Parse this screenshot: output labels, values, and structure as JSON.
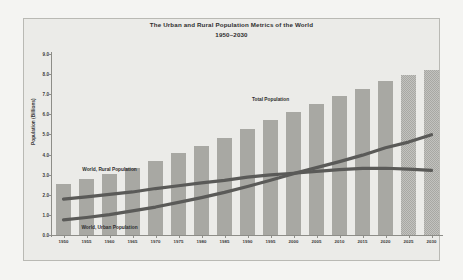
{
  "chart_data": {
    "type": "bar",
    "title": "The Urban and Rural Population Metrics of the World",
    "subtitle": "1950–2030",
    "xlabel": "",
    "ylabel": "Population (Billions)",
    "ylim": [
      0.0,
      9.0
    ],
    "yticks": [
      "0.0",
      "1.0",
      "2.0",
      "3.0",
      "4.0",
      "5.0",
      "6.0",
      "7.0",
      "8.0",
      "9.0"
    ],
    "grid": false,
    "legend_position": "inline-annotations",
    "categories": [
      "1950",
      "1955",
      "1960",
      "1965",
      "1970",
      "1975",
      "1980",
      "1985",
      "1990",
      "1995",
      "2000",
      "2005",
      "2010",
      "2015",
      "2020",
      "2025",
      "2030"
    ],
    "series": [
      {
        "name": "Total Population",
        "type": "bar",
        "color": "#a8a8a3",
        "values": [
          2.53,
          2.77,
          3.03,
          3.34,
          3.7,
          4.07,
          4.45,
          4.84,
          5.29,
          5.71,
          6.12,
          6.51,
          6.9,
          7.28,
          7.66,
          7.94,
          8.2
        ]
      },
      {
        "name": "World, Rural Population",
        "type": "line",
        "color": "#5a5a58",
        "values": [
          1.78,
          1.9,
          2.02,
          2.14,
          2.31,
          2.45,
          2.59,
          2.72,
          2.88,
          2.99,
          3.07,
          3.16,
          3.25,
          3.31,
          3.32,
          3.28,
          3.21
        ]
      },
      {
        "name": "World, Urban Population",
        "type": "line",
        "color": "#5a5a58",
        "values": [
          0.75,
          0.87,
          1.01,
          1.2,
          1.39,
          1.62,
          1.86,
          2.12,
          2.41,
          2.72,
          3.05,
          3.35,
          3.65,
          3.97,
          4.34,
          4.62,
          4.99
        ]
      }
    ],
    "annotations": [
      {
        "text": "Total Population",
        "x_category": "1995",
        "y_value": 6.75
      },
      {
        "text": "World, Rural Population",
        "x_category": "1960",
        "y_value": 3.3
      },
      {
        "text": "World, Urban Population",
        "x_category": "1960",
        "y_value": 0.42
      }
    ]
  },
  "colors": {
    "panel_background": "#ebebe8",
    "figure_background": "#f4f4f2",
    "bar_fill": "#a8a8a3",
    "line_color": "#5a5a58",
    "axis_color": "#8d8d88",
    "text_color": "#2e2e2e"
  }
}
